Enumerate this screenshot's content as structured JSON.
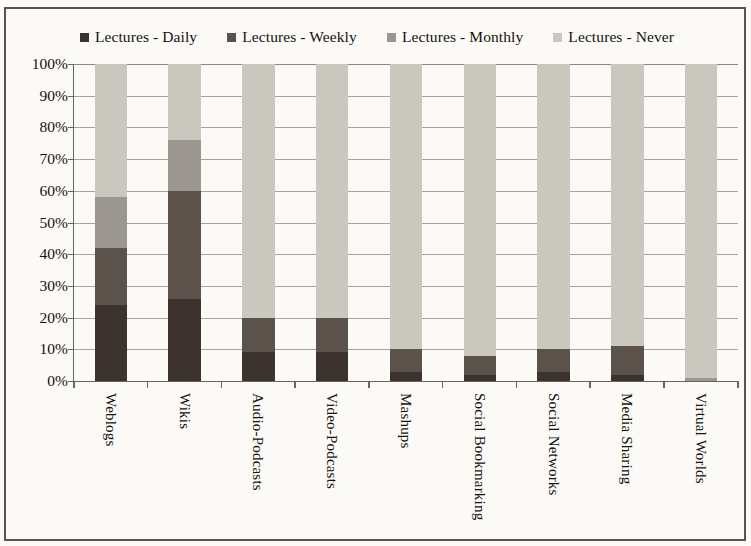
{
  "chart_data": {
    "type": "bar",
    "subtype": "stacked-bar-100",
    "title": "",
    "xlabel": "",
    "ylabel": "",
    "ylim": [
      0,
      100
    ],
    "ytick_labels": [
      "100%",
      "90%",
      "80%",
      "70%",
      "60%",
      "50%",
      "40%",
      "30%",
      "20%",
      "10%",
      "0%"
    ],
    "ytick_values": [
      100,
      90,
      80,
      70,
      60,
      50,
      40,
      30,
      20,
      10,
      0
    ],
    "grid": true,
    "legend_position": "top-center",
    "categories": [
      "Weblogs",
      "Wikis",
      "Audio-Podcasts",
      "Video-Podcasts",
      "Mashups",
      "Social Bookmarking",
      "Social Networks",
      "Media Sharing",
      "Virtual Worlds"
    ],
    "series": [
      {
        "name": "Lectures - Daily",
        "color": "#3c332e",
        "values": [
          24,
          26,
          9,
          9,
          3,
          2,
          3,
          2,
          0
        ]
      },
      {
        "name": "Lectures - Weekly",
        "color": "#5b524b",
        "values": [
          18,
          34,
          11,
          11,
          7,
          6,
          7,
          9,
          0
        ]
      },
      {
        "name": "Lectures - Monthly",
        "color": "#9b9790",
        "values": [
          16,
          16,
          0,
          0,
          0,
          0,
          0,
          0,
          1
        ]
      },
      {
        "name": "Lectures - Never",
        "color": "#cac7bf",
        "values": [
          42,
          24,
          80,
          80,
          90,
          92,
          90,
          89,
          99
        ]
      }
    ]
  },
  "legend": {
    "items": [
      {
        "label": "Lectures - Daily",
        "color": "#3c332e"
      },
      {
        "label": "Lectures - Weekly",
        "color": "#5b524b"
      },
      {
        "label": "Lectures - Monthly",
        "color": "#9b9790",
        "extra_margin": true
      },
      {
        "label": "Lectures - Never",
        "color": "#cac7bf"
      }
    ]
  },
  "colors": {
    "frame": "#59544c",
    "axis": "#6a645c",
    "gridline": "#a9a49a",
    "background": "#fbfaf6",
    "text": "#15120f"
  }
}
